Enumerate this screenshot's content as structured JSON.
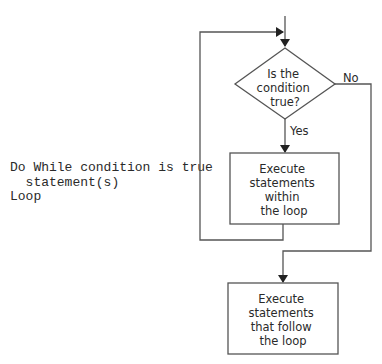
{
  "pseudocode": {
    "line1": "Do While condition is true",
    "line2": "  statement(s)",
    "line3": "Loop"
  },
  "flowchart": {
    "decision": {
      "line1": "Is the",
      "line2": "condition",
      "line3": "true?"
    },
    "yes_label": "Yes",
    "no_label": "No",
    "loop_body": {
      "line1": "Execute",
      "line2": "statements",
      "line3": "within",
      "line4": "the loop"
    },
    "after_loop": {
      "line1": "Execute",
      "line2": "statements",
      "line3": "that follow",
      "line4": "the loop"
    }
  },
  "colors": {
    "line": "#555555",
    "text": "#2a2a2a",
    "background": "#ffffff"
  }
}
